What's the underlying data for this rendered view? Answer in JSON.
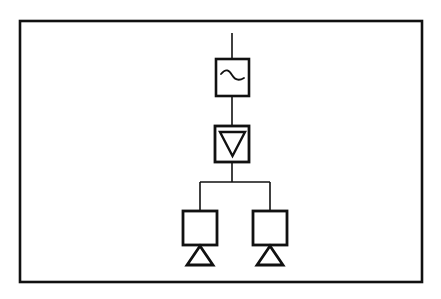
{
  "figure": {
    "background_color": "#ffffff",
    "stroke_color": "#111111",
    "border": {
      "x": 20,
      "y": 21,
      "width": 402,
      "height": 261,
      "stroke_width": 2.6
    }
  },
  "nodes": [
    {
      "id": "antenna-lead",
      "label": "input-lead",
      "type": "wire",
      "x1": 232,
      "y1": 33,
      "x2": 232,
      "y2": 59,
      "stroke_width": 1.6
    },
    {
      "id": "filter-block",
      "label": "filter-block",
      "type": "block",
      "glyph": "sine-curve",
      "x": 216,
      "y": 59,
      "width": 33,
      "height": 37,
      "stroke_width": 2.6
    },
    {
      "id": "link-filter-to-attenuator",
      "label": "connector-wire",
      "type": "wire",
      "x1": 232,
      "y1": 96,
      "x2": 232,
      "y2": 126,
      "stroke_width": 1.6
    },
    {
      "id": "attenuator-block",
      "label": "attenuator-block",
      "type": "block",
      "glyph": "down-triangle",
      "x": 215,
      "y": 126,
      "width": 34,
      "height": 36,
      "stroke_width": 2.8
    },
    {
      "id": "link-attenuator-to-split",
      "label": "connector-wire",
      "type": "wire",
      "x1": 232,
      "y1": 162,
      "x2": 232,
      "y2": 182,
      "stroke_width": 1.6
    },
    {
      "id": "splitter-bus",
      "label": "splitter-bus",
      "type": "wire",
      "x1": 200,
      "y1": 182,
      "x2": 270,
      "y2": 182,
      "stroke_width": 1.6
    },
    {
      "id": "drop-left",
      "label": "branch-wire-left",
      "type": "wire",
      "x1": 200,
      "y1": 182,
      "x2": 200,
      "y2": 211,
      "stroke_width": 1.6
    },
    {
      "id": "drop-right",
      "label": "branch-wire-right",
      "type": "wire",
      "x1": 270,
      "y1": 182,
      "x2": 270,
      "y2": 211,
      "stroke_width": 1.6
    },
    {
      "id": "output-block-left",
      "label": "output-block-left",
      "type": "block",
      "glyph": "empty",
      "x": 183,
      "y": 211,
      "width": 34,
      "height": 34,
      "stroke_width": 2.8
    },
    {
      "id": "output-block-right",
      "label": "output-block-right",
      "type": "block",
      "glyph": "empty",
      "x": 253,
      "y": 211,
      "width": 34,
      "height": 34,
      "stroke_width": 2.8
    },
    {
      "id": "ground-left",
      "label": "ground-triangle-left",
      "type": "triangle",
      "apex_x": 200,
      "apex_y": 246,
      "base_y": 265,
      "half_width": 13,
      "stroke_width": 2.8
    },
    {
      "id": "ground-right",
      "label": "ground-triangle-right",
      "type": "triangle",
      "apex_x": 270,
      "apex_y": 246,
      "base_y": 265,
      "half_width": 13,
      "stroke_width": 2.8
    }
  ],
  "glyphs": {
    "sine_curve": {
      "name": "sine-curve-icon",
      "path": "M 221 74 C 226 68 229 70 232 75 C 235 80 239 81 244 78",
      "stroke_width": 1.8
    },
    "down_triangle": {
      "name": "down-triangle-icon",
      "points": "220,132 245,132 232.5,156",
      "stroke_width": 2.4
    }
  }
}
